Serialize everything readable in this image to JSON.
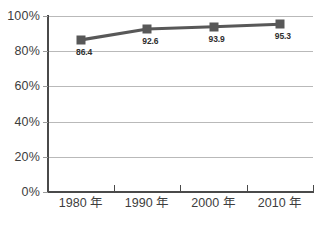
{
  "chart_data": {
    "type": "line",
    "title": "",
    "subtitle": "",
    "xlabel": "",
    "ylabel": "",
    "categories": [
      "1980 年",
      "1990 年",
      "2000 年",
      "2010 年"
    ],
    "values": [
      86.4,
      92.6,
      93.9,
      95.3
    ],
    "point_labels": [
      "86.4",
      "92.6",
      "93.9",
      "95.3"
    ],
    "series": [
      {
        "name": "",
        "values": [
          86.4,
          92.6,
          93.9,
          95.3
        ],
        "color": "#585858",
        "marker": "square"
      }
    ],
    "ylim": [
      0,
      100
    ],
    "y_ticks": [
      0,
      20,
      40,
      60,
      80,
      100
    ],
    "y_tick_labels": [
      "0%",
      "20%",
      "40%",
      "60%",
      "80%",
      "100%"
    ],
    "x_tick_labels": [
      "1980 年",
      "1990 年",
      "2000 年",
      "2010 年"
    ],
    "grid": true,
    "grid_axis": "y",
    "legend": false,
    "legend_position": "none",
    "units": "percent",
    "background_color": "#ffffff",
    "grid_color": "#b9b9b9",
    "axis_color": "#4a4a4a",
    "text_color": "#3d3d3d"
  }
}
